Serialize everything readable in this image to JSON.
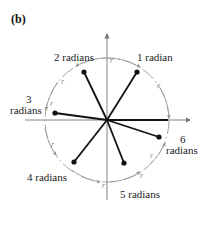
{
  "panel_label": "(b)",
  "center": {
    "x": 107,
    "y": 120
  },
  "circle_radius": 65,
  "colors": {
    "lines": "#111111",
    "circle": "#9a9a9a",
    "axes": "#777777"
  },
  "arc_label": "r",
  "angles": [
    {
      "name": "1 radian",
      "line1": "1 radian",
      "line2": "",
      "dot": {
        "x": 137,
        "y": 72
      }
    },
    {
      "name": "2 radians",
      "line1": "2 radians",
      "line2": "",
      "dot": {
        "x": 84,
        "y": 72
      }
    },
    {
      "name": "3 radians",
      "line1": "3",
      "line2": "radians",
      "dot": {
        "x": 55,
        "y": 113
      }
    },
    {
      "name": "4 radians",
      "line1": "4 radians",
      "line2": "",
      "dot": {
        "x": 74,
        "y": 162
      }
    },
    {
      "name": "5 radians",
      "line1": "5 radians",
      "line2": "",
      "dot": {
        "x": 124,
        "y": 163
      }
    },
    {
      "name": "6 radians",
      "line1": "6",
      "line2": "radians",
      "dot": {
        "x": 159,
        "y": 137
      }
    }
  ]
}
